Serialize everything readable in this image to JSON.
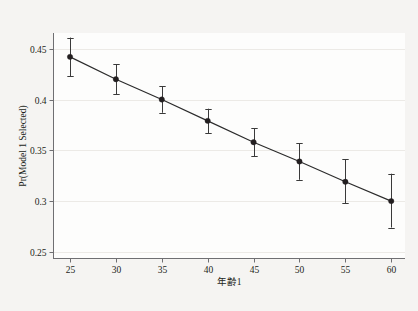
{
  "chart_data": {
    "type": "line",
    "title": "",
    "subtitle": "",
    "xlabel": "年齢1",
    "ylabel": "Pr(Model 1 Selected)",
    "x": [
      25,
      30,
      35,
      40,
      45,
      50,
      55,
      60
    ],
    "values": [
      0.442,
      0.42,
      0.4,
      0.379,
      0.358,
      0.339,
      0.319,
      0.3
    ],
    "error_low": [
      0.423,
      0.405,
      0.387,
      0.367,
      0.344,
      0.321,
      0.298,
      0.274
    ],
    "error_high": [
      0.461,
      0.435,
      0.413,
      0.391,
      0.372,
      0.357,
      0.341,
      0.327
    ],
    "series": [
      {
        "name": "Pr(Model 1 Selected)",
        "values": [
          0.442,
          0.42,
          0.4,
          0.379,
          0.358,
          0.339,
          0.319,
          0.3
        ]
      }
    ],
    "xlim": [
      23.2,
      61.5
    ],
    "ylim": [
      0.2435,
      0.4655
    ],
    "xticks": [
      25,
      30,
      35,
      40,
      45,
      50,
      55,
      60
    ],
    "xticklabels": [
      "25",
      "30",
      "35",
      "40",
      "45",
      "50",
      "55",
      "60"
    ],
    "yticks": [
      0.25,
      0.3,
      0.35,
      0.4,
      0.45
    ],
    "yticklabels": [
      "0.25",
      "0.3",
      "0.35",
      "0.4",
      "0.45"
    ],
    "grid": true,
    "grid_axis": "y",
    "legend": false,
    "legend_position": "none",
    "marker": "filled-circle",
    "has_error_bars": true,
    "colors": {
      "line": "#2b2b2b",
      "marker": "#231f20",
      "errorbar": "#3a3a3a",
      "axis": "#6f6f72",
      "grid": "#eceae6",
      "plot_background": "#fdfdfc",
      "figure_background": "#f5f4f2",
      "text": "#231f20"
    }
  }
}
